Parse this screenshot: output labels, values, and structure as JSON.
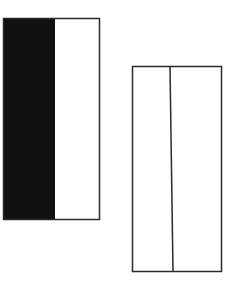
{
  "diagram": {
    "canvas": {
      "width": 230,
      "height": 294,
      "background": "#ffffff"
    },
    "stroke_color": "#2a2a2a",
    "fill_color": "#111111",
    "shapes": [
      {
        "name": "left-rectangle",
        "x": 3,
        "y": 18,
        "width": 97,
        "height": 202,
        "filled_left_portion": {
          "x": 3,
          "width": 52
        },
        "divisions": 2
      },
      {
        "name": "right-rectangle",
        "x": 132,
        "y": 66,
        "width": 90,
        "height": 206,
        "divider_x": [
          170,
          173
        ],
        "divisions": 2
      }
    ]
  }
}
